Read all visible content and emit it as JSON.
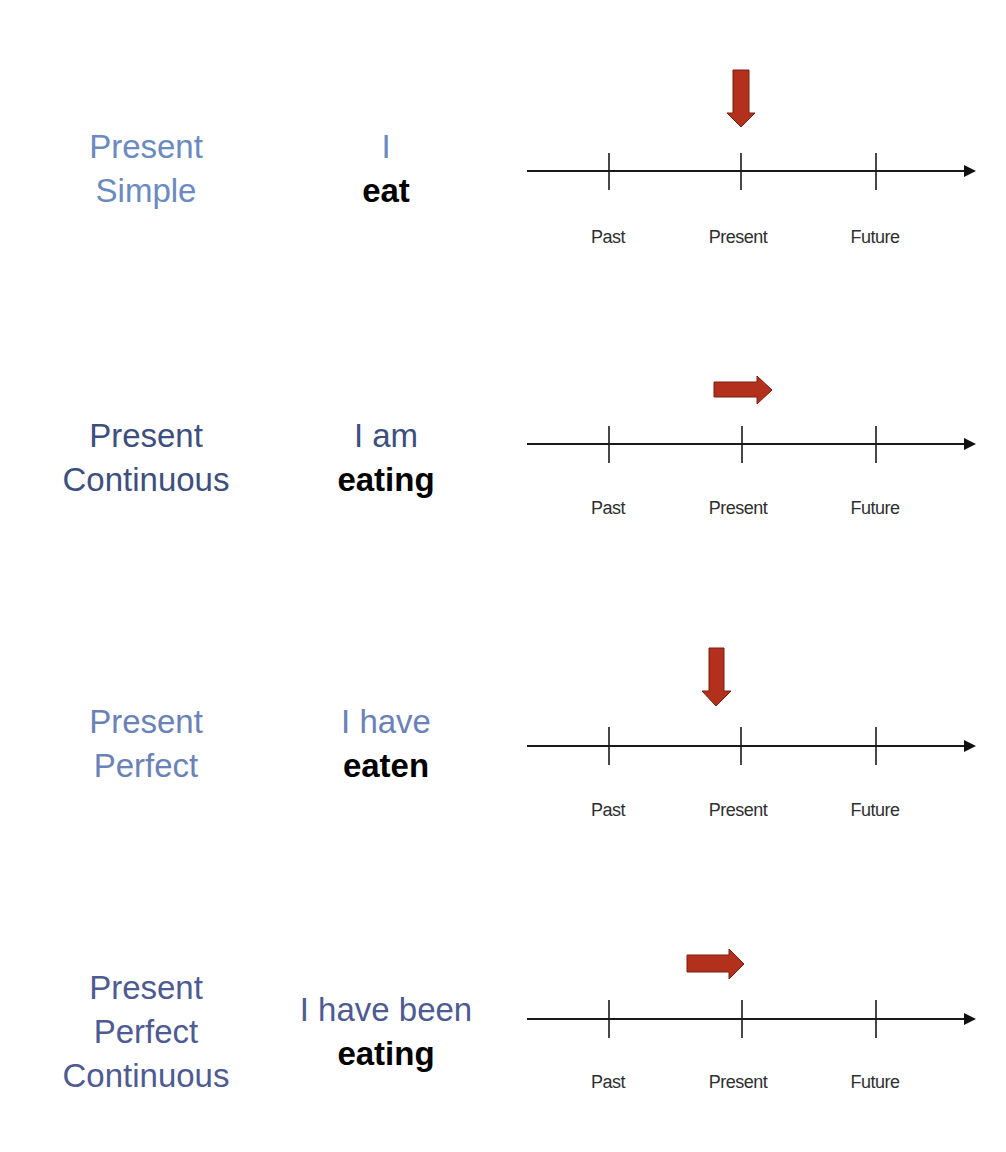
{
  "colors": {
    "light_blue": "#6a8ac0",
    "navy": "#3c4f7e",
    "purple_navy": "#4e5a92",
    "arrow_red": "#b2301c",
    "arrow_edge": "#7a1e10",
    "line": "#1a1a1a",
    "label_gray": "#2e2e2e",
    "verb_black": "#000000"
  },
  "timeline_labels": [
    "Past",
    "Present",
    "Future"
  ],
  "rows": [
    {
      "tense": [
        "Present",
        "Simple"
      ],
      "subject": "I",
      "verb": "eat",
      "tense_color": "light_blue",
      "subject_color": "light_blue",
      "arrow": {
        "direction": "down",
        "position": "at-present"
      }
    },
    {
      "tense": [
        "Present",
        "Continuous"
      ],
      "subject": "I am",
      "verb": "eating",
      "tense_color": "navy",
      "subject_color": "navy",
      "arrow": {
        "direction": "right",
        "position": "through-present"
      }
    },
    {
      "tense": [
        "Present",
        "Perfect"
      ],
      "subject": "I have",
      "verb": "eaten",
      "tense_color": "light_blue",
      "subject_color": "light_blue",
      "arrow": {
        "direction": "down",
        "position": "just-before-present"
      }
    },
    {
      "tense": [
        "Present",
        "Perfect",
        "Continuous"
      ],
      "subject": "I have been",
      "verb": "eating",
      "tense_color": "purple_navy",
      "subject_color": "purple_navy",
      "arrow": {
        "direction": "right",
        "position": "up-to-present"
      }
    }
  ]
}
